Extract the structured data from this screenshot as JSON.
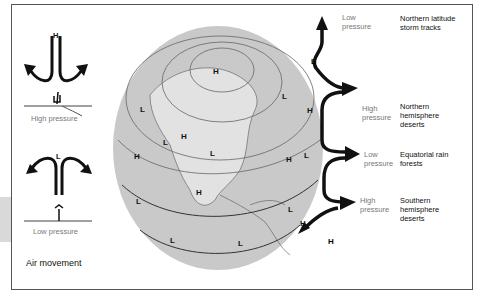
{
  "diagram": {
    "title": "Air movement",
    "left_panel": {
      "top": {
        "letter": "H",
        "caption": "High pressure"
      },
      "bottom": {
        "letter": "L",
        "caption": "Low pressure"
      }
    },
    "globe_labels": [
      "H",
      "L",
      "L",
      "L",
      "H",
      "L",
      "H",
      "L",
      "H",
      "H",
      "L",
      "L",
      "L",
      "L",
      "H",
      "L"
    ],
    "right_panel": [
      {
        "pressure": "Low pressure",
        "region": "Northern latitude storm tracks",
        "end_letter": "L"
      },
      {
        "pressure": "High pressure",
        "region": "Northern hemisphere deserts"
      },
      {
        "pressure": "Low pressure",
        "region": "Equatorial rain forests"
      },
      {
        "pressure": "High pressure",
        "region": "Southern hemisphere deserts",
        "end_letter": "H"
      }
    ],
    "colors": {
      "globe": "#c8c8c8",
      "land": "#e4e4e4",
      "ink": "#1a1a1a",
      "frame": "#555555"
    }
  }
}
